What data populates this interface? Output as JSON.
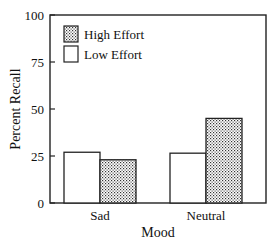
{
  "chart_data": {
    "type": "bar",
    "title": "",
    "xlabel": "Mood",
    "ylabel": "Percent Recall",
    "ylim": [
      0,
      100
    ],
    "yticks": [
      "0",
      "25",
      "50",
      "75",
      "100"
    ],
    "ytick_values": [
      0,
      25,
      50,
      75,
      100
    ],
    "categories": [
      "Sad",
      "Neutral"
    ],
    "series": [
      {
        "name": "Low Effort",
        "pattern": "white",
        "values": [
          27,
          26.5
        ]
      },
      {
        "name": "High Effort",
        "pattern": "stippled",
        "values": [
          23,
          45
        ]
      }
    ],
    "legend": {
      "placement": "top-left",
      "entries": [
        "High Effort",
        "Low Effort"
      ]
    },
    "grid": false
  }
}
